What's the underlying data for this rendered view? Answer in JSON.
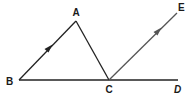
{
  "figure": {
    "type": "geometry-diagram",
    "points": {
      "A": {
        "label": "A",
        "x": 76,
        "y": 21
      },
      "B": {
        "label": "B",
        "x": 19,
        "y": 80
      },
      "C": {
        "label": "C",
        "x": 109,
        "y": 80
      },
      "D": {
        "label": "D",
        "x": 178,
        "y": 80
      },
      "E": {
        "label": "E",
        "x": 177,
        "y": 13
      }
    },
    "segments": [
      {
        "from": "B",
        "to": "A",
        "arrow": true,
        "note": "parallel mark"
      },
      {
        "from": "A",
        "to": "C",
        "arrow": false
      },
      {
        "from": "B",
        "to": "D",
        "arrow": false
      },
      {
        "from": "C",
        "to": "E",
        "arrow": true,
        "note": "parallel mark"
      }
    ],
    "relations": [
      "BA parallel to CE"
    ],
    "colors": {
      "line": "#222222",
      "ray_ce": "#555555",
      "label": "#1a1a1a",
      "background": "#ffffff"
    }
  }
}
